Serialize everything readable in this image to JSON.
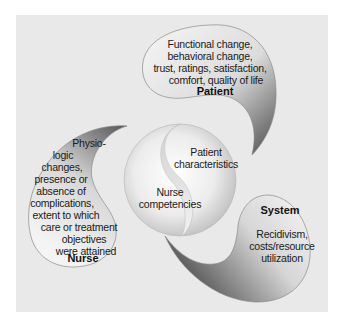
{
  "diagram": {
    "type": "outcomes-model",
    "center": {
      "top_label": "Patient characteristics",
      "top_lines": [
        "Patient",
        "characteristics"
      ],
      "bottom_label": "Nurse competencies",
      "bottom_lines": [
        "Nurse",
        "competencies"
      ]
    },
    "patient": {
      "title": "Patient",
      "lines": [
        "Functional change,",
        "behavioral change,",
        "trust, ratings, satisfaction,",
        "comfort, quality of life"
      ]
    },
    "nurse": {
      "title": "Nurse",
      "lines": [
        "Physio-",
        "logic",
        "changes,",
        "presence or",
        "absence of",
        "complications,",
        "extent to which",
        "care or treatment",
        "objectives",
        "were attained"
      ]
    },
    "system": {
      "title": "System",
      "lines": [
        "Recidivism,",
        "costs/resource",
        "utilization"
      ]
    },
    "colors": {
      "background_panel": "#e9e9e9",
      "shape_light": "#f4f4f4",
      "shape_dark": "#5a5a5a",
      "outline": "#8a8a8a",
      "text": "#1a1a1a"
    }
  }
}
